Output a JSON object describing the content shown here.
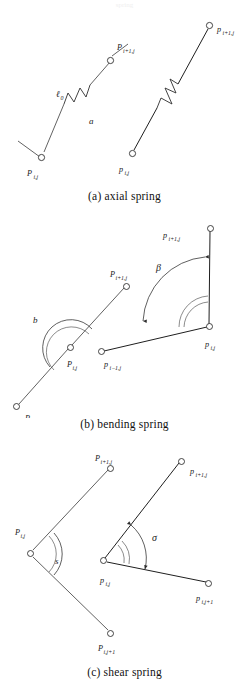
{
  "figure": {
    "top_partial_text": "spring",
    "panels": [
      {
        "id": "axial",
        "caption": "(a) axial spring",
        "left_diagram": {
          "labels": {
            "rest_length": "ℓ",
            "rest_length_sub": "0",
            "deformed_length": "a",
            "node_start": "P",
            "node_start_sub": "i,j",
            "node_end": "P",
            "node_end_sub": "i+1,j"
          }
        },
        "right_diagram": {
          "labels": {
            "node_start": "p",
            "node_start_sub": "i,j",
            "node_end": "p",
            "node_end_sub": "i+1,j"
          }
        }
      },
      {
        "id": "bending",
        "caption": "(b) bending spring",
        "left_diagram": {
          "labels": {
            "angle": "b",
            "node_prev": "P",
            "node_prev_sub": "i−1,j",
            "node_mid": "P",
            "node_mid_sub": "i,j",
            "node_next": "P",
            "node_next_sub": "i+1,j"
          }
        },
        "right_diagram": {
          "labels": {
            "angle": "β",
            "node_prev": "p",
            "node_prev_sub": "i−1,j",
            "node_mid": "p",
            "node_mid_sub": "i,j",
            "node_next": "p",
            "node_next_sub": "i+1,j"
          }
        }
      },
      {
        "id": "shear",
        "caption": "(c) shear spring",
        "left_diagram": {
          "labels": {
            "angle": "s",
            "node_corner": "P",
            "node_corner_sub": "i,j",
            "node_up": "P",
            "node_up_sub": "i+1,j",
            "node_down": "P",
            "node_down_sub": "i,j+1"
          }
        },
        "right_diagram": {
          "labels": {
            "angle": "σ",
            "node_corner": "p",
            "node_corner_sub": "i,j",
            "node_up": "p",
            "node_up_sub": "i+1,j",
            "node_down": "p",
            "node_down_sub": "i,j+1"
          }
        }
      }
    ]
  }
}
